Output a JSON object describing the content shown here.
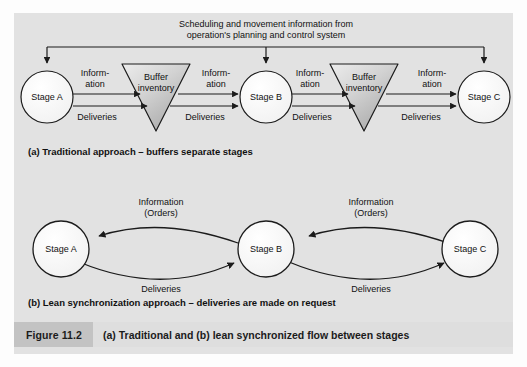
{
  "figure": {
    "number": "Figure 11.2",
    "caption": "(a) Traditional and (b) lean synchronized flow between stages"
  },
  "diagram_a": {
    "caption": "(a) Traditional approach – buffers separate stages",
    "bus_label_line1": "Scheduling and movement information from",
    "bus_label_line2": "operation's planning and control system",
    "stages": [
      {
        "label": "Stage A"
      },
      {
        "label": "Stage B"
      },
      {
        "label": "Stage C"
      }
    ],
    "buffers": [
      {
        "label_line1": "Buffer",
        "label_line2": "inventory"
      },
      {
        "label_line1": "Buffer",
        "label_line2": "inventory"
      }
    ],
    "flows": [
      {
        "info_line1": "Inform-",
        "info_line2": "ation",
        "deliveries": "Deliveries"
      },
      {
        "info_line1": "Inform-",
        "info_line2": "ation",
        "deliveries": "Deliveries"
      },
      {
        "info_line1": "Inform-",
        "info_line2": "ation",
        "deliveries": "Deliveries"
      },
      {
        "info_line1": "Inform-",
        "info_line2": "ation",
        "deliveries": "Deliveries"
      }
    ]
  },
  "diagram_b": {
    "caption": "(b) Lean synchronization approach – deliveries are made on request",
    "stages": [
      {
        "label": "Stage A"
      },
      {
        "label": "Stage B"
      },
      {
        "label": "Stage C"
      }
    ],
    "links": [
      {
        "info_line1": "Information",
        "info_line2": "(Orders)",
        "deliveries": "Deliveries"
      },
      {
        "info_line1": "Information",
        "info_line2": "(Orders)",
        "deliveries": "Deliveries"
      }
    ]
  },
  "colors": {
    "panel_background": "#e2e2e2",
    "page_background": "#fdfdfd",
    "node_fill": "#fbfbfb",
    "buffer_fill_light": "#e8e8e8",
    "buffer_fill_dark": "#b4b4b4",
    "stroke": "#1b1b1b",
    "figure_number_background": "#c3c3c3",
    "caption_background": "#dedede",
    "text": "#111111"
  }
}
